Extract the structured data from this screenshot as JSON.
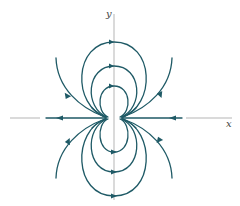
{
  "diagram": {
    "type": "phase-portrait",
    "axes": {
      "x_label": "x",
      "y_label": "y"
    },
    "colors": {
      "curve": "#1f5a66",
      "axis": "#b5b5b5",
      "label": "#444444",
      "background": "#ffffff"
    },
    "upper_orbits": [
      {
        "name": "small",
        "radius": 16,
        "arrow_direction": "right"
      },
      {
        "name": "medium",
        "radius": 26,
        "arrow_direction": "right"
      },
      {
        "name": "large",
        "radius": 38,
        "arrow_direction": "right"
      }
    ],
    "lower_orbits": [
      {
        "name": "small",
        "radius": 16,
        "arrow_direction": "right"
      },
      {
        "name": "medium",
        "radius": 26,
        "arrow_direction": "right"
      },
      {
        "name": "large",
        "radius": 38,
        "arrow_direction": "right"
      }
    ],
    "open_trajectories": [
      {
        "name": "upper-left",
        "arrow_direction": "up"
      },
      {
        "name": "upper-right",
        "arrow_direction": "down"
      },
      {
        "name": "lower-left",
        "arrow_direction": "up"
      },
      {
        "name": "lower-right",
        "arrow_direction": "down"
      }
    ],
    "axis_flow": [
      {
        "name": "left-ray",
        "arrow_direction": "left"
      },
      {
        "name": "right-ray",
        "arrow_direction": "left"
      }
    ]
  }
}
